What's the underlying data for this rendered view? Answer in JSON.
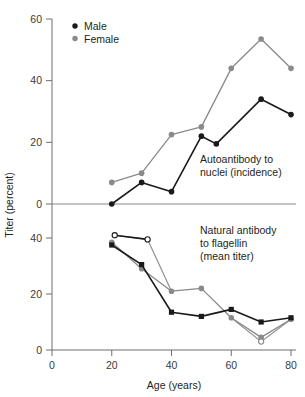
{
  "chart_data": {
    "type": "line",
    "title": "",
    "subtitle": "",
    "xlabel": "Age (years)",
    "ylabel": "Titer (percent)",
    "grid": false,
    "legend_position": "top-left",
    "xlim": [
      0,
      80
    ],
    "x_ticks": [
      0,
      20,
      40,
      60,
      80
    ],
    "x_tick_labels": [
      "0",
      "20",
      "40",
      "60",
      "80"
    ],
    "panels": [
      {
        "name": "upper",
        "annotation": "Autoantibody to nuclei (incidence)",
        "annotation_line1": "Autoantibody to",
        "annotation_line2": "nuclei (incidence)",
        "ylim": [
          0,
          60
        ],
        "y_ticks": [
          0,
          20,
          40,
          60
        ],
        "y_tick_labels": [
          "0",
          "20",
          "40",
          "60"
        ],
        "inverted": false,
        "series": [
          {
            "name": "Male",
            "marker": "filled-circle",
            "color": "#1a1a1a",
            "x": [
              20,
              30,
              40,
              50,
              55,
              70,
              80
            ],
            "values": [
              0,
              7,
              4,
              22,
              19.5,
              34,
              29
            ]
          },
          {
            "name": "Female",
            "marker": "filled-circle",
            "color": "#8a8a8a",
            "x": [
              20,
              30,
              40,
              50,
              60,
              70,
              80
            ],
            "values": [
              7,
              10,
              22.5,
              25,
              44,
              53.5,
              44
            ]
          }
        ]
      },
      {
        "name": "lower",
        "annotation": "Natural antibody to flagellin (mean titer)",
        "annotation_line1": "Natural antibody",
        "annotation_line2": "to flagellin",
        "annotation_line3": "(mean titer)",
        "ylim": [
          0,
          40
        ],
        "y_ticks": [
          0,
          20,
          40
        ],
        "y_tick_labels": [
          "0",
          "20",
          "40"
        ],
        "inverted": true,
        "series": [
          {
            "name": "Male",
            "marker": "filled-square",
            "color": "#1a1a1a",
            "x": [
              20,
              30,
              40,
              50,
              60,
              70,
              80
            ],
            "values": [
              37.5,
              30.5,
              13.5,
              12,
              14.5,
              10,
              11.5
            ]
          },
          {
            "name": "Female",
            "marker": "filled-circle",
            "color": "#8a8a8a",
            "x": [
              20,
              30,
              40,
              50,
              60,
              70,
              80
            ],
            "values": [
              38.5,
              29,
              21,
              22,
              11.5,
              4.5,
              11
            ]
          },
          {
            "name": "Male open",
            "marker": "open-circle",
            "color": "#1a1a1a",
            "x": [
              21,
              32
            ],
            "values": [
              41,
              39.5
            ]
          },
          {
            "name": "Female open",
            "marker": "open-circle",
            "color": "#8a8a8a",
            "x": [
              70
            ],
            "values": [
              3
            ]
          }
        ]
      }
    ],
    "legend": [
      {
        "label": "Male",
        "color": "#1a1a1a",
        "marker": "filled-circle"
      },
      {
        "label": "Female",
        "color": "#8a8a8a",
        "marker": "filled-circle"
      }
    ],
    "colors": {
      "male": "#1a1a1a",
      "female": "#8a8a8a",
      "axis": "#6e6e6e",
      "text": "#231f20",
      "background": "#ffffff"
    }
  }
}
